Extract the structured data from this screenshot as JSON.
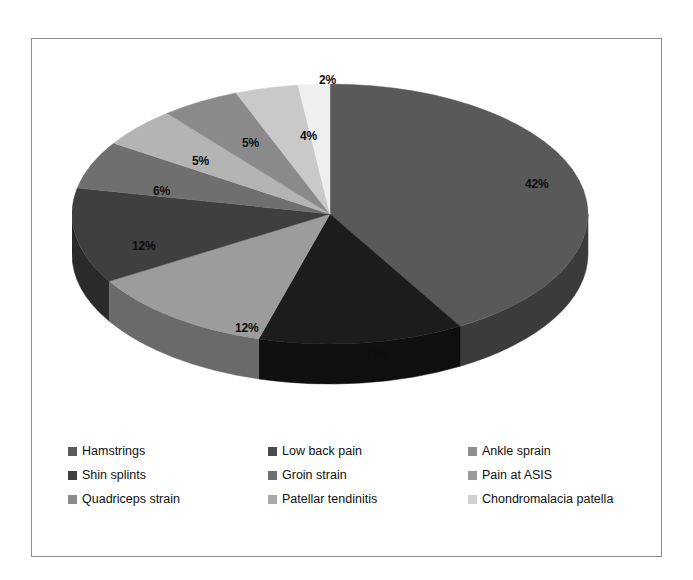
{
  "chart_data": {
    "type": "pie",
    "title": "",
    "three_d": true,
    "start_angle_deg": 0,
    "direction": "clockwise",
    "categories": [
      "Hamstrings",
      "Low back pain",
      "Ankle sprain",
      "Shin splints",
      "Groin strain",
      "Pain at ASIS",
      "Quadriceps strain",
      "Patellar tendinitis",
      "Chondromalacia patella"
    ],
    "values": [
      42,
      13,
      12,
      12,
      6,
      5,
      5,
      4,
      2
    ],
    "value_unit": "%",
    "data_labels": [
      "42%",
      "13%",
      "12%",
      "12%",
      "6%",
      "5%",
      "5%",
      "4%",
      "2%"
    ],
    "colors": [
      "#595959",
      "#1c1c1c",
      "#9c9c9c",
      "#3f3f3f",
      "#6f6f6f",
      "#b4b4b4",
      "#8a8a8a",
      "#c9c9c9",
      "#efefef"
    ],
    "side_colors": [
      "#3b3b3b",
      "#0f0f0f",
      "#6a6a6a",
      "#2a2a2a",
      "#4a4a4a",
      "#7a7a7a",
      "#5d5d5d",
      "#8a8a8a",
      "#a5a5a5"
    ],
    "legend_position": "bottom",
    "legend_columns": 3,
    "grid": false,
    "xlabel": "",
    "ylabel": ""
  },
  "labels": {
    "l0": "42%",
    "l1": "13%",
    "l2": "12%",
    "l3": "12%",
    "l4": "6%",
    "l5": "5%",
    "l6": "5%",
    "l7": "4%",
    "l8": "2%"
  },
  "legend": {
    "items": [
      {
        "label": "Hamstrings",
        "color": "#595959"
      },
      {
        "label": "Shin splints",
        "color": "#3f3f3f"
      },
      {
        "label": "Quadriceps strain",
        "color": "#8a8a8a"
      },
      {
        "label": "Low back pain",
        "color": "#4a4a4a"
      },
      {
        "label": "Groin strain",
        "color": "#6f6f6f"
      },
      {
        "label": "Patellar tendinitis",
        "color": "#a8a8a8"
      },
      {
        "label": "Ankle sprain",
        "color": "#8e8e8e"
      },
      {
        "label": "Pain at ASIS",
        "color": "#9a9a9a"
      },
      {
        "label": "Chondromalacia patella",
        "color": "#d0d0d0"
      }
    ]
  },
  "frame": {
    "border_color": "#8d8d8d",
    "background": "#ffffff"
  }
}
